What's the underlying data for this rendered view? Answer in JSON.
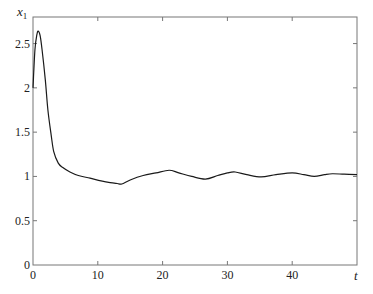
{
  "chart_data": {
    "type": "line",
    "title": "",
    "xlabel": "t",
    "ylabel": "x1",
    "ylabel_main": "x",
    "ylabel_sub": "1",
    "xlim": [
      0,
      50
    ],
    "ylim": [
      0,
      2.8
    ],
    "grid": false,
    "legend": null,
    "x_ticks": [
      0,
      10,
      20,
      30,
      40
    ],
    "x_tick_labels": [
      "0",
      "10",
      "20",
      "30",
      "40"
    ],
    "y_ticks": [
      0,
      0.5,
      1,
      1.5,
      2,
      2.5
    ],
    "y_tick_labels": [
      "0",
      "0.5",
      "1",
      "1.5",
      "2",
      "2.5"
    ],
    "series": [
      {
        "name": "x1",
        "color": "#1a1a1a",
        "x": [
          0,
          0.3,
          0.6,
          0.8,
          1.1,
          1.4,
          1.9,
          2.3,
          2.8,
          3.2,
          3.9,
          4.6,
          5.7,
          7.0,
          8.8,
          10.5,
          11.9,
          13.0,
          13.7,
          15.0,
          17.0,
          19.0,
          21.0,
          22.5,
          24.5,
          26.6,
          28.5,
          30.0,
          31.2,
          33.0,
          35.2,
          37.5,
          40.0,
          41.8,
          43.4,
          45.0,
          46.2,
          48.0,
          50.0
        ],
        "y": [
          2.0,
          2.43,
          2.6,
          2.64,
          2.59,
          2.43,
          2.09,
          1.75,
          1.47,
          1.28,
          1.15,
          1.1,
          1.05,
          1.01,
          0.98,
          0.95,
          0.93,
          0.92,
          0.915,
          0.96,
          1.01,
          1.04,
          1.07,
          1.04,
          1.0,
          0.97,
          1.01,
          1.04,
          1.05,
          1.02,
          0.995,
          1.02,
          1.04,
          1.02,
          1.0,
          1.02,
          1.03,
          1.025,
          1.02
        ]
      }
    ]
  },
  "style": {
    "axis_color": "#777777",
    "line_color": "#1a1a1a",
    "background": "#ffffff"
  }
}
